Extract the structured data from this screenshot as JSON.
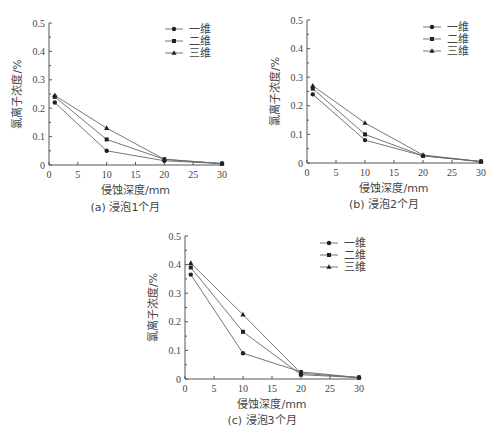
{
  "chart_data": [
    {
      "type": "line",
      "title": "(a) 浸泡1个月",
      "xlabel": "侵蚀深度/mm",
      "ylabel": "氯离子浓度/%",
      "xlim": [
        0,
        30
      ],
      "ylim": [
        0,
        0.5
      ],
      "xticks": [
        "0",
        "5",
        "10",
        "15",
        "20",
        "25",
        "30"
      ],
      "yticks": [
        "0",
        "0.1",
        "0.2",
        "0.3",
        "0.4",
        "0.5"
      ],
      "legend_position": "top-right",
      "x": [
        1,
        10,
        20,
        30
      ],
      "series": [
        {
          "name": "一维",
          "marker": "circle",
          "values": [
            0.22,
            0.05,
            0.015,
            0.005
          ]
        },
        {
          "name": "二维",
          "marker": "square",
          "values": [
            0.24,
            0.09,
            0.02,
            0.005
          ]
        },
        {
          "name": "三维",
          "marker": "triangle",
          "values": [
            0.245,
            0.13,
            0.02,
            0.005
          ]
        }
      ]
    },
    {
      "type": "line",
      "title": "(b) 浸泡2个月",
      "xlabel": "侵蚀深度/mm",
      "ylabel": "氯离子浓度/%",
      "xlim": [
        0,
        30
      ],
      "ylim": [
        0,
        0.5
      ],
      "xticks": [
        "0",
        "5",
        "10",
        "15",
        "20",
        "25",
        "30"
      ],
      "yticks": [
        "0",
        "0.1",
        "0.2",
        "0.3",
        "0.4",
        "0.5"
      ],
      "legend_position": "top-right",
      "x": [
        1,
        10,
        20,
        30
      ],
      "series": [
        {
          "name": "一维",
          "marker": "circle",
          "values": [
            0.24,
            0.08,
            0.025,
            0.005
          ]
        },
        {
          "name": "二维",
          "marker": "square",
          "values": [
            0.26,
            0.1,
            0.025,
            0.005
          ]
        },
        {
          "name": "三维",
          "marker": "triangle",
          "values": [
            0.27,
            0.14,
            0.028,
            0.005
          ]
        }
      ]
    },
    {
      "type": "line",
      "title": "(c) 浸泡3个月",
      "xlabel": "侵蚀深度/mm",
      "ylabel": "氯离子浓度/%",
      "xlim": [
        0,
        30
      ],
      "ylim": [
        0,
        0.5
      ],
      "xticks": [
        "0",
        "5",
        "10",
        "15",
        "20",
        "25",
        "30"
      ],
      "yticks": [
        "0",
        "0.1",
        "0.2",
        "0.3",
        "0.4",
        "0.5"
      ],
      "legend_position": "top-right",
      "x": [
        1,
        10,
        20,
        30
      ],
      "series": [
        {
          "name": "一维",
          "marker": "circle",
          "values": [
            0.365,
            0.09,
            0.025,
            0.005
          ]
        },
        {
          "name": "二维",
          "marker": "square",
          "values": [
            0.39,
            0.165,
            0.015,
            0.005
          ]
        },
        {
          "name": "三维",
          "marker": "triangle",
          "values": [
            0.405,
            0.225,
            0.02,
            0.005
          ]
        }
      ]
    }
  ],
  "colors": {
    "axis": "#555555",
    "line": "#666666",
    "marker": "#222222"
  }
}
